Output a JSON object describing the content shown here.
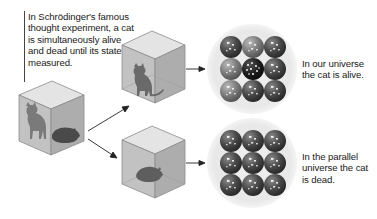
{
  "intro": {
    "text": "In Schrödinger's famous thought experiment, a cat is simultaneously alive and dead until its state is measured."
  },
  "outcomes": [
    {
      "id": "alive",
      "caption": "In our universe the cat is alive.",
      "cat_state": "alive"
    },
    {
      "id": "dead",
      "caption": "In the parallel universe the cat is dead.",
      "cat_state": "dead"
    }
  ],
  "source_box": {
    "cat_state": "superposition (alive and dead)"
  },
  "colors": {
    "box_top": "#e6e6e6",
    "box_front": "#bdbdbd",
    "box_side": "#a8a8a8",
    "box_edge": "#8a8a8a",
    "cat": "#6b6b6b",
    "cat_dark": "#4a4a4a",
    "circle_bg": "#ececec",
    "sphere_dark": "#3d3d3d",
    "sphere_mid": "#6e6e6e",
    "sphere_light": "#9a9a9a",
    "arrow": "#222222",
    "text": "#1a1a1a"
  }
}
